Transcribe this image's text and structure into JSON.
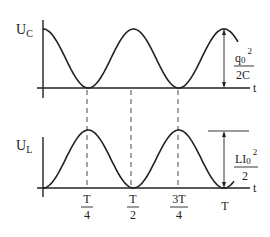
{
  "diagram": {
    "top_graph": {
      "ylabel_main": "U",
      "ylabel_sub": "C",
      "xlabel": "t",
      "amplitude_label": {
        "num_main": "q",
        "num_sub": "0",
        "num_sup": "2",
        "den": "2C"
      },
      "curve": "cos^2"
    },
    "bottom_graph": {
      "ylabel_main": "U",
      "ylabel_sub": "L",
      "xlabel": "t",
      "amplitude_label": {
        "num_main": "LI",
        "num_sub": "0",
        "num_sup": "2",
        "den": "2"
      },
      "curve": "sin^2"
    },
    "ticks": [
      {
        "num": "T",
        "den": "4"
      },
      {
        "num": "T",
        "den": "2"
      },
      {
        "num": "3T",
        "den": "4"
      },
      {
        "single": "T"
      }
    ],
    "colors": {
      "line": "#222222",
      "background": "#ffffff"
    }
  }
}
